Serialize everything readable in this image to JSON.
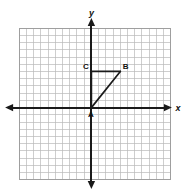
{
  "figure": {
    "width": 183,
    "height": 193,
    "background_color": "#ffffff"
  },
  "chart_data": {
    "type": "scatter",
    "title": "",
    "xlabel": "x",
    "ylabel": "y",
    "grid": true,
    "legend": false,
    "xlim": [
      -10,
      11
    ],
    "ylim": [
      -10,
      11
    ],
    "grid_step": 1,
    "axes": {
      "x_axis_label": "x",
      "y_axis_label": "y",
      "x_axis_arrows": [
        "left",
        "right"
      ],
      "y_axis_arrows": [
        "up",
        "down"
      ],
      "tick_labels_shown": false,
      "axis_color": "#1a1a1a",
      "grid_color": "#b9b9b9"
    },
    "points": [
      {
        "name": "A",
        "x": 0,
        "y": 0,
        "label": "A",
        "label_position": "below"
      },
      {
        "name": "B",
        "x": 4,
        "y": 5,
        "label": "B",
        "label_position": "above-right"
      },
      {
        "name": "C",
        "x": 0,
        "y": 5,
        "label": "C",
        "label_position": "above-left"
      }
    ],
    "shapes": [
      {
        "kind": "triangle",
        "name": "triangle-ABC",
        "vertices": [
          "A",
          "B",
          "C"
        ],
        "sides": [
          {
            "from": "C",
            "to": "B",
            "orientation": "horizontal"
          },
          {
            "from": "B",
            "to": "A",
            "orientation": "diagonal"
          },
          {
            "from": "A",
            "to": "C",
            "orientation": "vertical"
          }
        ],
        "stroke_color": "#1a1a1a",
        "filled": false
      }
    ]
  },
  "labels": {
    "x_axis": "x",
    "y_axis": "y",
    "point_a": "A",
    "point_b": "B",
    "point_c": "C"
  }
}
